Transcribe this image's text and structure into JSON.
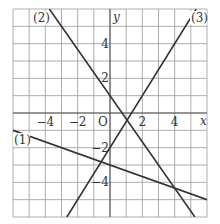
{
  "chart_data": {
    "type": "line",
    "title": "",
    "xlabel": "x",
    "ylabel": "y",
    "origin_label": "O",
    "xlim": [
      -6,
      6
    ],
    "ylim": [
      -6,
      6
    ],
    "grid": true,
    "grid_step": 1,
    "x_ticks": [
      {
        "value": -4,
        "label": "−4"
      },
      {
        "value": -2,
        "label": "−2"
      },
      {
        "value": 2,
        "label": "2"
      },
      {
        "value": 4,
        "label": "4"
      }
    ],
    "y_ticks": [
      {
        "value": 4,
        "label": "4"
      },
      {
        "value": 2,
        "label": "2"
      },
      {
        "value": -2,
        "label": "−2"
      },
      {
        "value": -4,
        "label": "−4"
      }
    ],
    "series": [
      {
        "name": "(1)",
        "equation": "y = -1/3 x - 3",
        "slope": -0.3333,
        "intercept": -3,
        "points": [
          [
            -6,
            -1
          ],
          [
            6,
            -5
          ]
        ]
      },
      {
        "name": "(2)",
        "equation": "y = -4/3 x + 1",
        "slope": -1.3333,
        "intercept": 1,
        "points": [
          [
            -3.75,
            6
          ],
          [
            5.25,
            -6
          ]
        ]
      },
      {
        "name": "(3)",
        "equation": "y = 3/2 x - 2",
        "slope": 1.5,
        "intercept": -2,
        "points": [
          [
            -2.667,
            -6
          ],
          [
            5.333,
            6
          ]
        ]
      }
    ],
    "line_color": "#333333",
    "grid_color": "#999999"
  }
}
